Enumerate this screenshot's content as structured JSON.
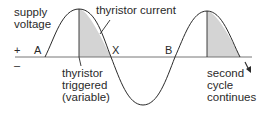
{
  "diagram": {
    "type": "waveform",
    "labels": {
      "supply_voltage": "supply\nvoltage",
      "thyristor_current": "thyristor current",
      "thyristor_triggered": "thyristor\ntriggered\n(variable)",
      "second_cycle": "second\ncycle\ncontinues",
      "point_a": "A",
      "point_x": "X",
      "point_b": "B",
      "plus_sign": "+",
      "minus_sign": "–"
    },
    "colors": {
      "line": "#2a2a2a",
      "shade": "#d4d4d4",
      "axis": "#555555"
    }
  }
}
